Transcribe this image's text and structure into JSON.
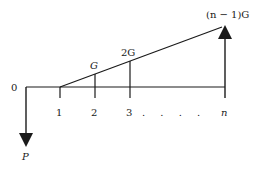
{
  "diagram": {
    "type": "cash-flow-diagram",
    "origin_label": "0",
    "initial_flow_label": "P",
    "period_labels": [
      "1",
      "2",
      "3",
      "n"
    ],
    "ellipsis": ". . . .",
    "gradient_labels": [
      "G",
      "2G"
    ],
    "final_label": "(n − 1)G",
    "colors": {
      "line": "#1a1a1a",
      "background": "#ffffff"
    }
  }
}
